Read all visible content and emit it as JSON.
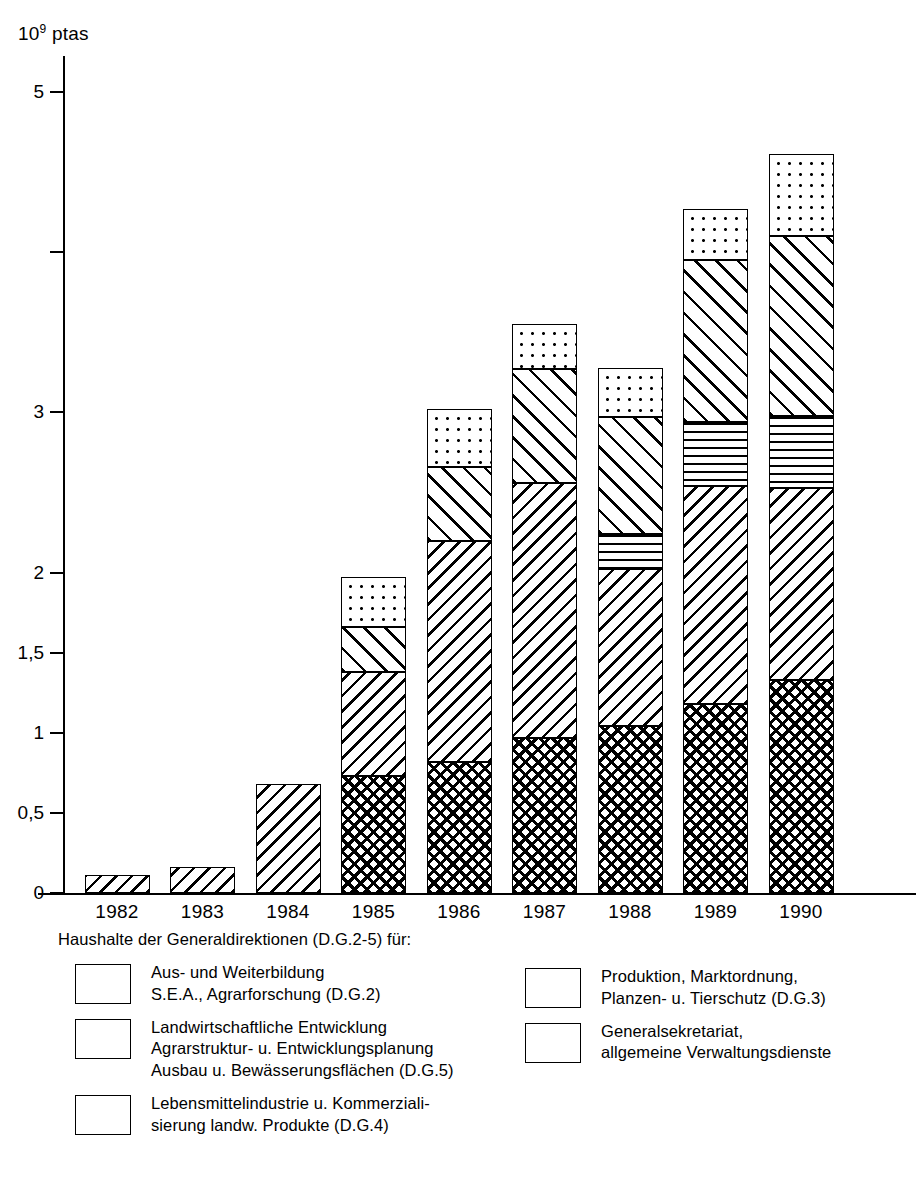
{
  "axis": {
    "unit_label_base": "10",
    "unit_label_exp": "9",
    "unit_label_suffix": " ptas",
    "y_ticks": [
      {
        "label": "5",
        "value": 5.0
      },
      {
        "label": "",
        "value": 4.0
      },
      {
        "label": "3",
        "value": 3.0
      },
      {
        "label": "2",
        "value": 2.0
      },
      {
        "label": "1,5",
        "value": 1.5
      },
      {
        "label": "1",
        "value": 1.0
      },
      {
        "label": "0,5",
        "value": 0.5
      },
      {
        "label": "0",
        "value": 0.0
      }
    ]
  },
  "legend": {
    "title": "Haushalte der Generaldirektionen (D.G.2-5) für:",
    "items_left": [
      {
        "key": "dg2",
        "pattern": "cross-hatch",
        "text": "Aus- und Weiterbildung\nS.E.A., Agrarforschung (D.G.2)"
      },
      {
        "key": "dg5",
        "pattern": "fine-diagonal",
        "text": "Landwirtschaftliche Entwicklung\nAgrarstruktur- u. Entwicklungsplanung\nAusbau u. Bewässerungsflächen (D.G.5)"
      },
      {
        "key": "dg4",
        "pattern": "horizontal-lines",
        "text": "Lebensmittelindustrie u. Kommerziali-\nsierung landw. Produkte (D.G.4)"
      }
    ],
    "items_right": [
      {
        "key": "dg3",
        "pattern": "wide-diagonal",
        "text": "Produktion, Marktordnung,\nPlanzen- u. Tierschutz (D.G.3)"
      },
      {
        "key": "gs",
        "pattern": "dots",
        "text": "Generalsekretariat,\nallgemeine Verwaltungsdienste"
      }
    ]
  },
  "chart_data": {
    "type": "bar",
    "subtype": "stacked",
    "title": "Haushalte der Generaldirektionen (D.G.2-5) für:",
    "xlabel": "",
    "ylabel": "10^9 ptas",
    "ylim": [
      0,
      5.2
    ],
    "grid": false,
    "legend_position": "below",
    "categories": [
      "1982",
      "1983",
      "1984",
      "1985",
      "1986",
      "1987",
      "1988",
      "1989",
      "1990"
    ],
    "series": [
      {
        "name": "Aus- und Weiterbildung S.E.A., Agrarforschung (D.G.2)",
        "key": "dg2",
        "pattern": "cross-hatch",
        "values": [
          0.0,
          0.0,
          0.0,
          0.73,
          0.82,
          0.97,
          1.04,
          1.18,
          1.33
        ]
      },
      {
        "name": "Landwirtschaftliche Entwicklung, Agrarstruktur- u. Entwicklungsplanung, Ausbau u. Bewässerungsflächen (D.G.5)",
        "key": "dg5",
        "pattern": "fine-diagonal",
        "values": [
          0.11,
          0.16,
          0.68,
          0.65,
          1.38,
          1.59,
          0.98,
          1.36,
          1.2
        ]
      },
      {
        "name": "Lebensmittelindustrie u. Kommerzialisierung landw. Produkte (D.G.4)",
        "key": "dg4",
        "pattern": "horizontal-lines",
        "values": [
          0.0,
          0.0,
          0.0,
          0.0,
          0.0,
          0.0,
          0.22,
          0.4,
          0.45
        ]
      },
      {
        "name": "Produktion, Marktordnung, Planzen- u. Tierschutz (D.G.3)",
        "key": "dg3",
        "pattern": "wide-diagonal",
        "values": [
          0.0,
          0.0,
          0.0,
          0.28,
          0.46,
          0.71,
          0.73,
          1.01,
          1.12
        ]
      },
      {
        "name": "Generalsekretariat, allgemeine Verwaltungsdienste",
        "key": "gs",
        "pattern": "dots",
        "values": [
          0.0,
          0.0,
          0.0,
          0.31,
          0.36,
          0.28,
          0.31,
          0.32,
          0.51
        ]
      }
    ],
    "totals": [
      0.11,
      0.16,
      0.68,
      1.97,
      3.02,
      3.55,
      3.28,
      4.27,
      4.61
    ]
  }
}
